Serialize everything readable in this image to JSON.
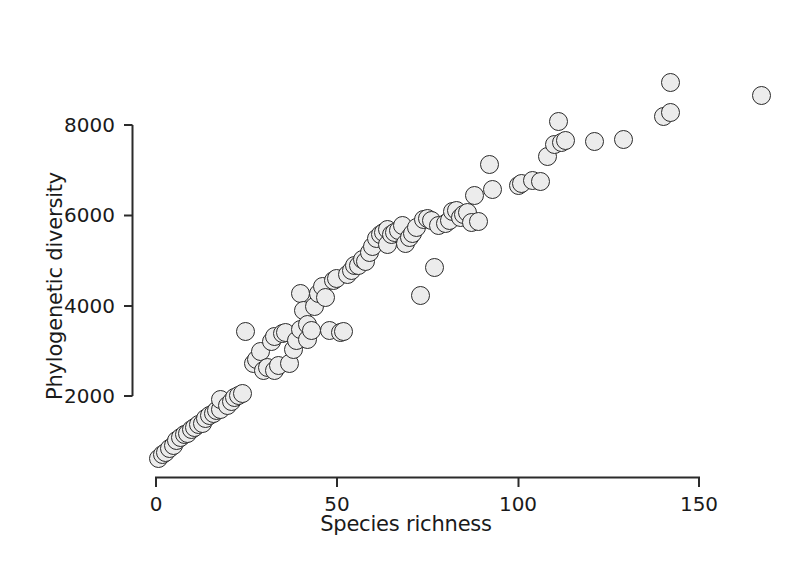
{
  "chart_data": {
    "type": "scatter",
    "title": "",
    "xlabel": "Species richness",
    "ylabel": "Phylogenetic diversity",
    "xlim": [
      0,
      170
    ],
    "ylim": [
      0,
      9200
    ],
    "xticks": [
      0,
      50,
      100,
      150
    ],
    "yticks": [
      2000,
      4000,
      6000,
      8000
    ],
    "xtick_labels": [
      "0",
      "50",
      "100",
      "150"
    ],
    "ytick_labels": [
      "2000",
      "4000",
      "6000",
      "8000"
    ],
    "grid": false,
    "legend": null,
    "marker": {
      "shape": "circle",
      "fill_color": "#ececec",
      "edge_color": "#2b2b2b",
      "size_px": 19
    },
    "axis_color": "#2b2b2b",
    "series": [
      {
        "name": "sites",
        "points": [
          [
            1,
            620
          ],
          [
            2,
            700
          ],
          [
            3,
            760
          ],
          [
            4,
            830
          ],
          [
            5,
            900
          ],
          [
            6,
            1020
          ],
          [
            7,
            1080
          ],
          [
            8,
            1150
          ],
          [
            9,
            1180
          ],
          [
            10,
            1260
          ],
          [
            11,
            1310
          ],
          [
            12,
            1380
          ],
          [
            13,
            1400
          ],
          [
            14,
            1500
          ],
          [
            15,
            1560
          ],
          [
            16,
            1620
          ],
          [
            17,
            1680
          ],
          [
            18,
            1700
          ],
          [
            18,
            1930
          ],
          [
            20,
            1800
          ],
          [
            21,
            1880
          ],
          [
            22,
            1960
          ],
          [
            23,
            2020
          ],
          [
            24,
            2060
          ],
          [
            25,
            3420
          ],
          [
            27,
            2720
          ],
          [
            28,
            2800
          ],
          [
            29,
            2980
          ],
          [
            30,
            2560
          ],
          [
            31,
            2620
          ],
          [
            32,
            3200
          ],
          [
            33,
            3320
          ],
          [
            33,
            2560
          ],
          [
            34,
            2680
          ],
          [
            35,
            3380
          ],
          [
            36,
            3400
          ],
          [
            37,
            2720
          ],
          [
            38,
            3020
          ],
          [
            39,
            3220
          ],
          [
            40,
            3480
          ],
          [
            40,
            4260
          ],
          [
            41,
            3900
          ],
          [
            42,
            3580
          ],
          [
            42,
            3250
          ],
          [
            43,
            3460
          ],
          [
            44,
            3980
          ],
          [
            45,
            4280
          ],
          [
            46,
            4420
          ],
          [
            47,
            4180
          ],
          [
            48,
            3460
          ],
          [
            49,
            4550
          ],
          [
            50,
            4600
          ],
          [
            51,
            3400
          ],
          [
            52,
            3420
          ],
          [
            53,
            4700
          ],
          [
            54,
            4780
          ],
          [
            55,
            4880
          ],
          [
            56,
            4900
          ],
          [
            57,
            5020
          ],
          [
            58,
            4980
          ],
          [
            59,
            5180
          ],
          [
            60,
            5320
          ],
          [
            61,
            5480
          ],
          [
            62,
            5580
          ],
          [
            63,
            5620
          ],
          [
            64,
            5680
          ],
          [
            64,
            5360
          ],
          [
            65,
            5580
          ],
          [
            66,
            5620
          ],
          [
            67,
            5660
          ],
          [
            68,
            5780
          ],
          [
            69,
            5380
          ],
          [
            70,
            5520
          ],
          [
            71,
            5600
          ],
          [
            72,
            5740
          ],
          [
            73,
            4220
          ],
          [
            74,
            5900
          ],
          [
            75,
            5940
          ],
          [
            76,
            5880
          ],
          [
            77,
            4840
          ],
          [
            78,
            5780
          ],
          [
            80,
            5820
          ],
          [
            81,
            5880
          ],
          [
            82,
            6080
          ],
          [
            83,
            6100
          ],
          [
            84,
            5960
          ],
          [
            85,
            6020
          ],
          [
            86,
            6060
          ],
          [
            87,
            5840
          ],
          [
            88,
            6440
          ],
          [
            89,
            5860
          ],
          [
            92,
            7120
          ],
          [
            93,
            6580
          ],
          [
            100,
            6660
          ],
          [
            101,
            6700
          ],
          [
            104,
            6780
          ],
          [
            106,
            6760
          ],
          [
            108,
            7300
          ],
          [
            110,
            7560
          ],
          [
            111,
            8080
          ],
          [
            112,
            7620
          ],
          [
            113,
            7660
          ],
          [
            121,
            7640
          ],
          [
            129,
            7680
          ],
          [
            140,
            8180
          ],
          [
            142,
            8280
          ],
          [
            142,
            8950
          ],
          [
            167,
            8650
          ]
        ]
      }
    ]
  },
  "geometry": {
    "x0_px": 155,
    "x_per_unit": 3.6333,
    "y_2000_px": 396,
    "y_per_unit": 0.045167
  }
}
